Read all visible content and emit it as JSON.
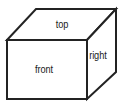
{
  "diagram": {
    "type": "3d-box",
    "background_color": "#ffffff",
    "line_color": "#232323",
    "line_width_px": 2,
    "text_color": "#1b1b1b",
    "canvas": {
      "width": 123,
      "height": 107
    },
    "vertices": {
      "front_top_left": [
        7,
        40
      ],
      "front_top_right": [
        87,
        40
      ],
      "front_bottom_right": [
        87,
        99
      ],
      "front_bottom_left": [
        7,
        99
      ],
      "back_top_left": [
        36,
        9
      ],
      "back_top_right": [
        116,
        9
      ],
      "back_bottom_right": [
        116,
        72
      ]
    },
    "faces": [
      {
        "id": "top",
        "label": "top",
        "points": "7,40 36,9 116,9 87,40"
      },
      {
        "id": "front",
        "label": "front",
        "points": "7,40 87,40 87,99 7,99"
      },
      {
        "id": "right",
        "label": "right",
        "points": "87,40 116,9 116,72 87,99"
      }
    ]
  }
}
